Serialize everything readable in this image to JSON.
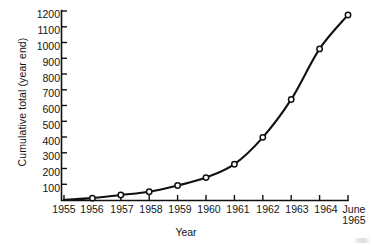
{
  "chart_data": {
    "type": "line",
    "title": "",
    "subtitle": "",
    "xlabel": "Year",
    "ylabel": "Cumulative total (year end)",
    "categories": [
      "1955",
      "1956",
      "1957",
      "1958",
      "1959",
      "1960",
      "1961",
      "1962",
      "1963",
      "1964",
      "June 1965"
    ],
    "x_tick_labels": [
      "1955",
      "1956",
      "1957",
      "1958",
      "1959",
      "1960",
      "1961",
      "1962",
      "1963",
      "1964",
      "June"
    ],
    "x_tick_labels_line2": [
      "",
      "",
      "",
      "",
      "",
      "",
      "",
      "",
      "",
      "",
      "1965"
    ],
    "y_tick_labels": [
      "100",
      "200",
      "300",
      "400",
      "500",
      "600",
      "700",
      "800",
      "900",
      "1000",
      "1100",
      "1200"
    ],
    "y_ticks": [
      100,
      200,
      300,
      400,
      500,
      600,
      700,
      800,
      900,
      1000,
      1100,
      1200
    ],
    "ylim": [
      0,
      1200
    ],
    "x": [
      "1955",
      "1956",
      "1957",
      "1958",
      "1959",
      "1960",
      "1961",
      "1962",
      "1963",
      "1964",
      "June 1965"
    ],
    "values": [
      5,
      15,
      35,
      55,
      95,
      145,
      230,
      400,
      640,
      960,
      1175
    ],
    "series": [
      {
        "name": "Cumulative total",
        "values": [
          5,
          15,
          35,
          55,
          95,
          145,
          230,
          400,
          640,
          960,
          1175
        ],
        "marker": "open-circle",
        "line_color": "#111111",
        "marker_face_color": "#ffffff"
      }
    ],
    "grid": false,
    "legend": false,
    "legend_position": "none",
    "axis_color": "#111111"
  },
  "figure": {
    "background_color": "#ffffff",
    "text_color": "#141414"
  }
}
